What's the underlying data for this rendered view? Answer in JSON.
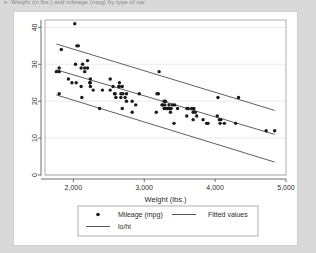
{
  "caption": "e. Weight (in lbs.) and mileage (mpg) by type of car",
  "chart_data": {
    "type": "scatter",
    "title": "",
    "xlabel": "Weight (lbs.)",
    "ylabel": "",
    "xlim": [
      1600,
      5000
    ],
    "ylim": [
      0,
      42
    ],
    "xticks": [
      2000,
      3000,
      4000,
      5000
    ],
    "xticklabels": [
      "2,000",
      "3,000",
      "4,000",
      "5,000"
    ],
    "yticks": [
      0,
      10,
      20,
      30,
      40
    ],
    "yticklabels": [
      "0",
      "10",
      "20",
      "30",
      "40"
    ],
    "grid": "horizontal",
    "legend_position": "bottom",
    "legend": [
      {
        "label": "Mileage (mpg)",
        "marker": "circle"
      },
      {
        "label": "Fitted values",
        "marker": "line"
      },
      {
        "label": "lo/hi",
        "marker": "line"
      }
    ],
    "series": [
      {
        "name": "Mileage (mpg)",
        "marker": "circle",
        "color": "#1a1a1a",
        "x": [
          1760,
          1800,
          1800,
          1830,
          1800,
          1930,
          1980,
          2020,
          2030,
          2040,
          2050,
          2070,
          2110,
          2110,
          2120,
          2130,
          2160,
          2160,
          2200,
          2200,
          2230,
          2240,
          2240,
          2240,
          2280,
          2370,
          2410,
          2520,
          2520,
          2560,
          2580,
          2590,
          2600,
          2640,
          2650,
          2650,
          2670,
          2670,
          2690,
          2690,
          2700,
          2730,
          2750,
          2750,
          2830,
          2830,
          2880,
          2930,
          3170,
          3180,
          3200,
          3210,
          3250,
          3260,
          3280,
          3280,
          3290,
          3300,
          3310,
          3330,
          3350,
          3350,
          3360,
          3370,
          3380,
          3400,
          3420,
          3430,
          3470,
          3600,
          3600,
          3620,
          3670,
          3690,
          3690,
          3700,
          3720,
          3740,
          3830,
          3880,
          3900,
          4030,
          4040,
          4060,
          4070,
          4080,
          4130,
          4290,
          4330,
          4720,
          4840
        ],
        "y": [
          28,
          28,
          29,
          34,
          22,
          26,
          25,
          41,
          30,
          25,
          35,
          35,
          24,
          29,
          21,
          30,
          28,
          29,
          31,
          29,
          25,
          25,
          26,
          24,
          23,
          18,
          23,
          26,
          23,
          24,
          22,
          22,
          21,
          24,
          24,
          25,
          22,
          21,
          18,
          24,
          22,
          21,
          20,
          22,
          17,
          20,
          19,
          22,
          17,
          22,
          22,
          28,
          19,
          19,
          18,
          20,
          19,
          20,
          18,
          18,
          18,
          19,
          18,
          17,
          18,
          19,
          14,
          19,
          18,
          18,
          16,
          18,
          18,
          17,
          15,
          18,
          17,
          16,
          15,
          14,
          14,
          16,
          21,
          15,
          14,
          15,
          14,
          14,
          21,
          12,
          12
        ]
      },
      {
        "name": "Fitted values",
        "type": "line",
        "color": "#2b2b2b",
        "x": [
          1760,
          4840
        ],
        "y": [
          28.5,
          11.0
        ]
      },
      {
        "name": "hi",
        "type": "line",
        "color": "#2b2b2b",
        "x": [
          1760,
          4840
        ],
        "y": [
          35.5,
          17.5
        ]
      },
      {
        "name": "lo",
        "type": "line",
        "color": "#2b2b2b",
        "x": [
          1760,
          4840
        ],
        "y": [
          21.7,
          3.5
        ]
      }
    ]
  },
  "colors": {
    "page_background": "#d9d9d9",
    "card_background": "#ffffff",
    "marker": "#1a1a1a",
    "line": "#2b2b2b",
    "grid": "#e8e8e8",
    "axis": "#4a4a4a"
  }
}
